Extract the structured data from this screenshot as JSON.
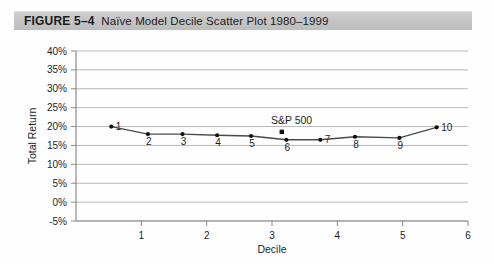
{
  "figure": {
    "number_label": "FIGURE 5–4",
    "caption": "Naïve Model Decile Scatter Plot 1980–1999"
  },
  "chart_data": {
    "type": "scatter",
    "title": "Naïve Model Decile Scatter Plot 1980–1999",
    "xlabel": "Decile",
    "ylabel": "Total Return",
    "xlim": [
      0,
      6
    ],
    "ylim": [
      -0.05,
      0.4
    ],
    "xticks": [
      "1",
      "2",
      "3",
      "4",
      "5",
      "6"
    ],
    "xtick_values": [
      1,
      2,
      3,
      4,
      5,
      6
    ],
    "yticks": [
      "-5%",
      "0%",
      "5%",
      "10%",
      "15%",
      "20%",
      "25%",
      "30%",
      "35%",
      "40%"
    ],
    "ytick_values": [
      -5,
      0,
      5,
      10,
      15,
      20,
      25,
      30,
      35,
      40
    ],
    "grid": "horizontal",
    "legend": "none",
    "series": [
      {
        "name": "Decile portfolios",
        "marker": "dot",
        "labels": [
          "1",
          "2",
          "3",
          "4",
          "5",
          "6",
          "7",
          "8",
          "9",
          "10"
        ],
        "x": [
          0.54,
          1.1,
          1.63,
          2.16,
          2.68,
          3.22,
          3.74,
          4.27,
          4.95,
          5.52
        ],
        "y": [
          20.0,
          18.0,
          18.0,
          17.7,
          17.5,
          16.5,
          16.5,
          17.3,
          17.0,
          19.8
        ],
        "label_offsets": [
          "right",
          "below",
          "below",
          "below",
          "below",
          "below",
          "right",
          "below",
          "below",
          "right"
        ],
        "trendline": true
      },
      {
        "name": "S&P 500",
        "marker": "square",
        "label": "S&P 500",
        "x": [
          3.15
        ],
        "y": [
          18.6
        ]
      }
    ],
    "annotations": [
      {
        "text": "S&P 500",
        "x": 3.3,
        "y": 20.6
      }
    ]
  },
  "axis": {
    "y_title": "Total Return",
    "x_title": "Decile"
  },
  "colors": {
    "caption_bar": "#c6c6c6",
    "grid": "#b9b9b9",
    "axis": "#8a8a8a",
    "marker": "#101010",
    "trendline": "#4a4a4a",
    "text": "#1e1e1e"
  }
}
